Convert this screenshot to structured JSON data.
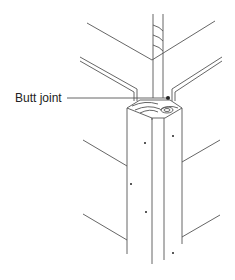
{
  "figure": {
    "labels": [
      {
        "text": "Butt joint",
        "x": 15,
        "y": 91
      }
    ],
    "colors": {
      "line": "#555555",
      "background": "#ffffff",
      "text": "#222222"
    }
  }
}
